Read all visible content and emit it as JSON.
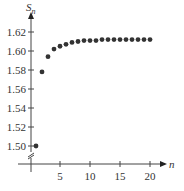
{
  "chart_data": {
    "type": "scatter",
    "title": "",
    "xlabel": "n",
    "ylabel": "S_n",
    "ylabel_main": "S",
    "ylabel_sub": "n",
    "xlim": [
      0,
      22
    ],
    "ylim": [
      1.49,
      1.635
    ],
    "y_axis_break": true,
    "grid": false,
    "legend": null,
    "x_ticks": [
      5,
      10,
      15,
      20
    ],
    "x_tick_labels": [
      "5",
      "10",
      "15",
      "20"
    ],
    "y_ticks": [
      1.5,
      1.52,
      1.54,
      1.56,
      1.58,
      1.6,
      1.62
    ],
    "y_tick_labels": [
      "1.50",
      "1.52",
      "1.54",
      "1.56",
      "1.58",
      "1.60",
      "1.62"
    ],
    "x": [
      1,
      2,
      3,
      4,
      5,
      6,
      7,
      8,
      9,
      10,
      11,
      12,
      13,
      14,
      15,
      16,
      17,
      18,
      19,
      20
    ],
    "values": [
      1.5,
      1.578,
      1.594,
      1.602,
      1.605,
      1.607,
      1.609,
      1.61,
      1.611,
      1.611,
      1.611,
      1.612,
      1.612,
      1.612,
      1.612,
      1.612,
      1.612,
      1.612,
      1.612,
      1.612
    ],
    "point_color": "#333333",
    "axis_color": "#444444"
  }
}
